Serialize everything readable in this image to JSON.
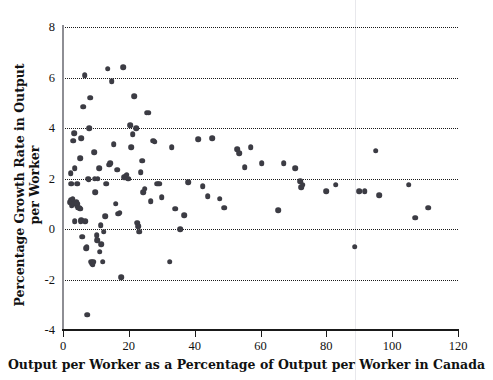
{
  "chart_data": {
    "type": "scatter",
    "title": "",
    "xlabel": "Output per Worker as a Percentage of Output per Worker in Canada",
    "ylabel": "Percentage Growth Rate in Output per Worker",
    "xlim": [
      0,
      120
    ],
    "ylim": [
      -4,
      8
    ],
    "xticks": [
      0,
      20,
      40,
      60,
      80,
      100,
      120
    ],
    "yticks": [
      -4,
      -2,
      0,
      2,
      4,
      6,
      8
    ],
    "xtick_labels": [
      "0",
      "20",
      "40",
      "60",
      "80",
      "100",
      "120"
    ],
    "ytick_labels": [
      "-4",
      "-2",
      "0",
      "2",
      "4",
      "6",
      "8"
    ],
    "grid": "horizontal-dotted",
    "gridlines_y": [
      -2,
      0,
      2,
      4,
      6,
      8
    ],
    "legend": "none",
    "marker_color": "#3c3c44",
    "marker_size_px": 5.6,
    "series": [
      {
        "name": "Countries",
        "points": [
          [
            2.2,
            1.05
          ],
          [
            2.4,
            1.15
          ],
          [
            2.6,
            0.95
          ],
          [
            2.8,
            1.1
          ],
          [
            3.0,
            1.2
          ],
          [
            3.2,
            1.0
          ],
          [
            2.3,
            2.2
          ],
          [
            2.5,
            1.8
          ],
          [
            3.1,
            3.5
          ],
          [
            3.4,
            3.8
          ],
          [
            3.6,
            2.4
          ],
          [
            3.5,
            0.3
          ],
          [
            4.0,
            1.05
          ],
          [
            4.2,
            0.95
          ],
          [
            4.4,
            1.0
          ],
          [
            4.6,
            0.85
          ],
          [
            4.3,
            1.8
          ],
          [
            5.0,
            0.85
          ],
          [
            5.2,
            0.8
          ],
          [
            5.4,
            0.3
          ],
          [
            5.6,
            0.35
          ],
          [
            5.3,
            2.8
          ],
          [
            5.5,
            3.6
          ],
          [
            5.8,
            -0.3
          ],
          [
            6.2,
            4.85
          ],
          [
            6.6,
            6.1
          ],
          [
            6.8,
            0.3
          ],
          [
            7.0,
            -0.75
          ],
          [
            7.2,
            -0.7
          ],
          [
            7.4,
            -3.4
          ],
          [
            7.6,
            2.0
          ],
          [
            7.8,
            1.95
          ],
          [
            8.0,
            4.0
          ],
          [
            8.2,
            5.2
          ],
          [
            8.6,
            -1.3
          ],
          [
            8.8,
            -1.35
          ],
          [
            9.0,
            -1.4
          ],
          [
            9.2,
            -1.3
          ],
          [
            9.4,
            3.05
          ],
          [
            9.6,
            2.0
          ],
          [
            9.8,
            1.45
          ],
          [
            10.2,
            -0.25
          ],
          [
            10.4,
            -0.45
          ],
          [
            10.6,
            2.0
          ],
          [
            11.0,
            2.4
          ],
          [
            11.2,
            -0.9
          ],
          [
            11.4,
            0.15
          ],
          [
            11.6,
            -0.6
          ],
          [
            12.0,
            -1.3
          ],
          [
            12.4,
            -0.1
          ],
          [
            12.8,
            0.5
          ],
          [
            13.2,
            1.8
          ],
          [
            13.6,
            6.35
          ],
          [
            14.0,
            2.55
          ],
          [
            14.4,
            2.6
          ],
          [
            14.8,
            5.85
          ],
          [
            15.4,
            3.35
          ],
          [
            16.0,
            1.0
          ],
          [
            16.4,
            2.35
          ],
          [
            16.8,
            0.6
          ],
          [
            17.2,
            0.65
          ],
          [
            17.6,
            -1.9
          ],
          [
            18.2,
            6.4
          ],
          [
            18.6,
            2.05
          ],
          [
            19.0,
            2.1
          ],
          [
            19.4,
            2.15
          ],
          [
            19.8,
            2.0
          ],
          [
            20.4,
            4.1
          ],
          [
            20.8,
            3.25
          ],
          [
            21.2,
            3.75
          ],
          [
            21.6,
            5.25
          ],
          [
            22.2,
            4.0
          ],
          [
            22.6,
            0.25
          ],
          [
            22.8,
            0.1
          ],
          [
            23.2,
            -0.1
          ],
          [
            23.6,
            2.25
          ],
          [
            24.0,
            2.7
          ],
          [
            24.4,
            1.45
          ],
          [
            24.8,
            1.6
          ],
          [
            25.4,
            4.6
          ],
          [
            26.0,
            4.6
          ],
          [
            26.6,
            1.1
          ],
          [
            27.4,
            3.5
          ],
          [
            27.8,
            3.45
          ],
          [
            28.6,
            1.8
          ],
          [
            29.2,
            1.8
          ],
          [
            30.0,
            1.25
          ],
          [
            32.4,
            -1.3
          ],
          [
            33.0,
            3.25
          ],
          [
            34.0,
            0.8
          ],
          [
            35.6,
            0.0
          ],
          [
            36.8,
            0.55
          ],
          [
            38.0,
            1.85
          ],
          [
            41.0,
            3.55
          ],
          [
            42.4,
            1.7
          ],
          [
            44.0,
            1.3
          ],
          [
            45.4,
            3.6
          ],
          [
            47.6,
            1.2
          ],
          [
            49.0,
            0.85
          ],
          [
            53.0,
            3.15
          ],
          [
            53.6,
            3.0
          ],
          [
            55.2,
            2.45
          ],
          [
            57.0,
            3.25
          ],
          [
            60.4,
            2.6
          ],
          [
            65.4,
            0.75
          ],
          [
            67.0,
            2.6
          ],
          [
            70.6,
            2.4
          ],
          [
            72.0,
            1.9
          ],
          [
            72.4,
            1.65
          ],
          [
            72.8,
            1.75
          ],
          [
            80.0,
            1.5
          ],
          [
            82.8,
            1.75
          ],
          [
            88.6,
            -0.7
          ],
          [
            90.0,
            1.5
          ],
          [
            91.6,
            1.5
          ],
          [
            95.0,
            3.1
          ],
          [
            96.0,
            1.35
          ],
          [
            105.0,
            1.75
          ],
          [
            107.0,
            0.45
          ],
          [
            111.0,
            0.85
          ]
        ]
      }
    ]
  }
}
